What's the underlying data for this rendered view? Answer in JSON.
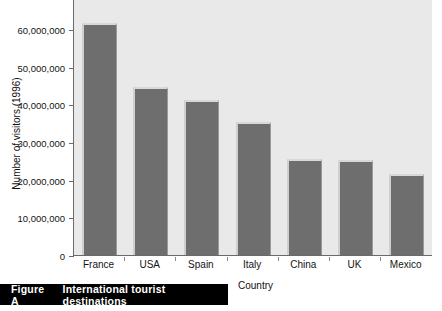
{
  "figure": {
    "caption_number": "Figure A",
    "caption_text": "International tourist destinations"
  },
  "chart_data": {
    "type": "bar",
    "title": "",
    "xlabel": "Country",
    "ylabel": "Number of visitors (1996)",
    "categories": [
      "France",
      "USA",
      "Spain",
      "Italy",
      "China",
      "UK",
      "Mexico"
    ],
    "values": [
      61500000,
      44700000,
      41200000,
      35300000,
      25500000,
      25200000,
      21500000
    ],
    "ylim": [
      0,
      65000000
    ],
    "yticks": [
      0,
      10000000,
      20000000,
      30000000,
      40000000,
      50000000,
      60000000
    ],
    "ytick_labels": [
      "0",
      "10,000,000",
      "20,000,000",
      "30,000,000",
      "40,000,000",
      "50,000,000",
      "60,000,000"
    ],
    "grid": false,
    "legend": "none",
    "bar_color": "#6e6e6e",
    "plot_background": "#e9e9e9"
  }
}
